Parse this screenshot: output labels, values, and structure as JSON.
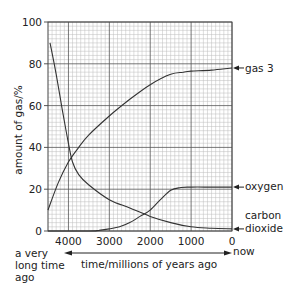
{
  "chart_data": {
    "type": "line",
    "title": "",
    "xlabel": "time/millions of years ago",
    "ylabel": "amount of gas/%",
    "xlim": [
      4500,
      0
    ],
    "ylim": [
      0,
      100
    ],
    "x_ticks": [
      4000,
      3000,
      2000,
      1000,
      0
    ],
    "y_ticks": [
      0,
      20,
      40,
      60,
      80,
      100
    ],
    "grid": true,
    "x_direction_labels": {
      "left": "a very long time ago",
      "right": "now"
    },
    "series": [
      {
        "name": "gas 3",
        "x": [
          4500,
          4250,
          4000,
          3750,
          3500,
          3000,
          2500,
          2000,
          1500,
          1200,
          1000,
          500,
          0
        ],
        "y": [
          10,
          23,
          33,
          40,
          46,
          55,
          63,
          70,
          75,
          76,
          76.5,
          77,
          78
        ]
      },
      {
        "name": "carbon dioxide",
        "x": [
          4450,
          4300,
          4150,
          4000,
          3900,
          3750,
          3500,
          3000,
          2500,
          2000,
          1500,
          1000,
          500,
          0
        ],
        "y": [
          90,
          75,
          58,
          42,
          33,
          27,
          22,
          15,
          11,
          7,
          4,
          2,
          1.3,
          1
        ]
      },
      {
        "name": "oxygen",
        "x": [
          4500,
          3500,
          3250,
          3000,
          2750,
          2500,
          2250,
          2000,
          1750,
          1500,
          1250,
          1000,
          500,
          0
        ],
        "y": [
          0,
          0,
          0.3,
          1,
          2,
          4,
          7,
          10,
          15,
          19.5,
          20.8,
          21,
          21,
          21
        ]
      }
    ],
    "annotations": [
      "gas 3",
      "oxygen",
      "carbon dioxide"
    ]
  },
  "labels": {
    "ylabel": "amount of gas/%",
    "xlabel": "time/millions of years ago",
    "left_note_1": "a very",
    "left_note_2": "long time",
    "left_note_3": "ago",
    "right_note": "now",
    "gas3": "gas 3",
    "oxygen": "oxygen",
    "co2_1": "carbon",
    "co2_2": "dioxide"
  }
}
